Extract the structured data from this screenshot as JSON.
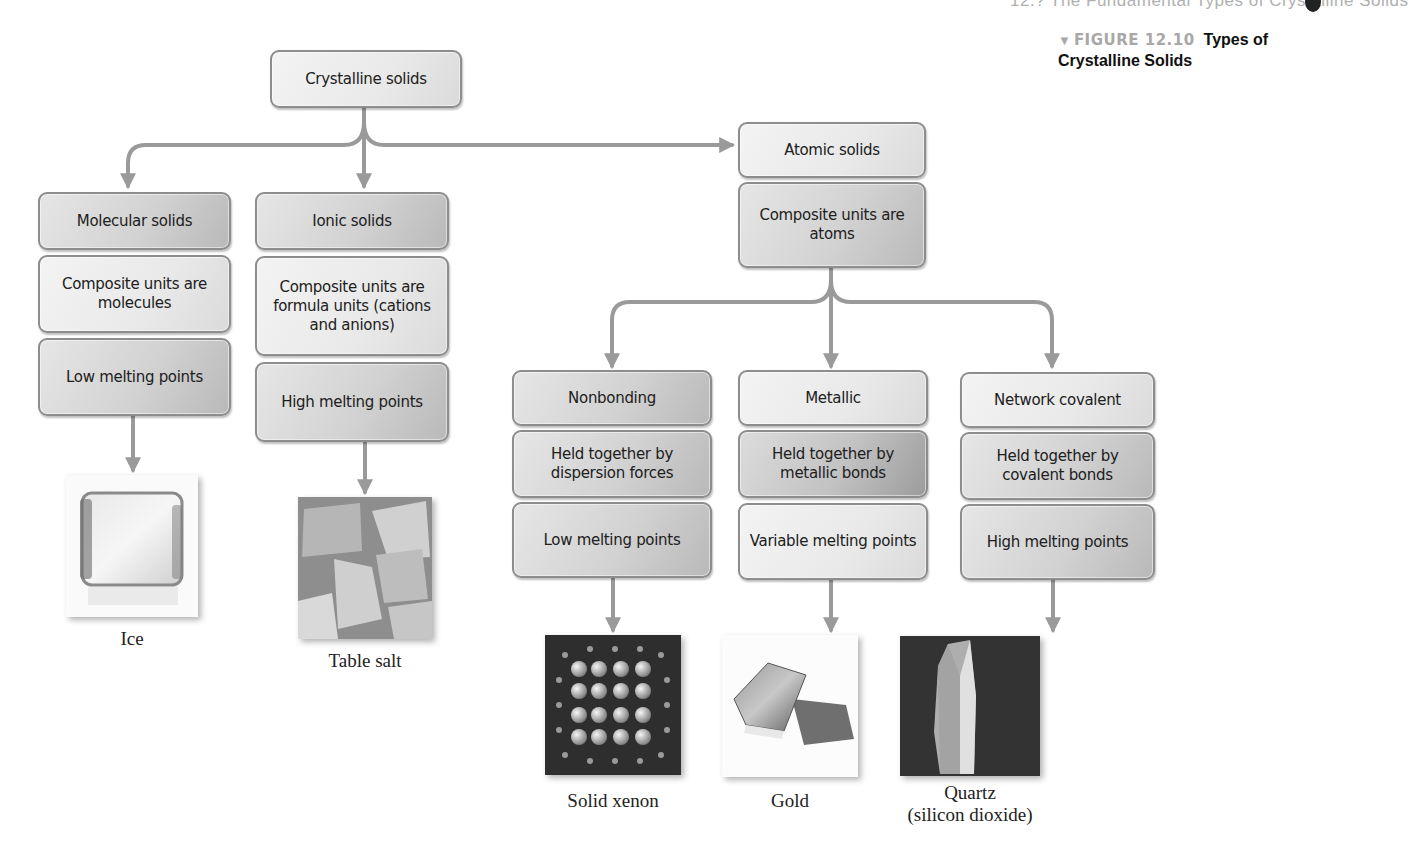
{
  "page": {
    "running_head": "12.? The Fundamental Types of Crystalline Solids",
    "figure": {
      "marker": "▼",
      "number": "FIGURE 12.10",
      "title": "Types of Crystalline Solids"
    }
  },
  "diagram": {
    "root": {
      "label": "Crystalline solids"
    },
    "molecular": {
      "title": "Molecular solids",
      "units": "Composite units are molecules",
      "melting": "Low melting points",
      "example": {
        "image": "ice-cube-photo",
        "caption": "Ice"
      }
    },
    "ionic": {
      "title": "Ionic solids",
      "units": "Composite units are formula units (cations and anions)",
      "melting": "High melting points",
      "example": {
        "image": "table-salt-photo",
        "caption": "Table salt"
      }
    },
    "atomic": {
      "title": "Atomic solids",
      "units": "Composite units are atoms",
      "children": [
        {
          "title": "Nonbonding",
          "bond": "Held together by dispersion forces",
          "melting": "Low melting points",
          "example": {
            "image": "solid-xenon-lattice",
            "caption": "Solid xenon"
          }
        },
        {
          "title": "Metallic",
          "bond": "Held together by metallic bonds",
          "melting": "Variable melting points",
          "example": {
            "image": "gold-bars-photo",
            "caption": "Gold"
          }
        },
        {
          "title": "Network covalent",
          "bond": "Held together by covalent bonds",
          "melting": "High melting points",
          "example": {
            "image": "quartz-crystal-photo",
            "caption": "Quartz",
            "subcaption": "(silicon dioxide)"
          }
        }
      ]
    }
  },
  "colors": {
    "arrow": "#9a9a9a",
    "box_border": "#8d8d8d",
    "figure_number": "#a8a8a8"
  }
}
